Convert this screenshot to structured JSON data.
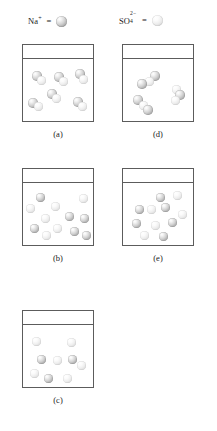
{
  "figure": {
    "caption": ""
  },
  "legend": {
    "entries": [
      {
        "id": "na",
        "species": "Na",
        "charge_sign": "+",
        "charge_number": "",
        "label_text": "Na+",
        "equals": "=",
        "sphere_kind": "cation",
        "sphere_color": "#b4b4b4",
        "icon_name": "cation-sphere-icon"
      },
      {
        "id": "so4",
        "species": "SO",
        "subscript": "4",
        "superscript": "2−",
        "label_text": "SO4 2-",
        "equals": "=",
        "sphere_kind": "anion",
        "sphere_color": "#e2e2e2",
        "icon_name": "anion-sphere-icon"
      }
    ]
  },
  "panels": [
    {
      "id": "a",
      "label": "(a)",
      "column": "left",
      "description": "ion pairs, cation and anion touching",
      "beaker": {
        "x": 22,
        "y": 44,
        "w": 72,
        "h": 78,
        "waterline_y": 13
      },
      "spheres": [
        {
          "kind": "cation",
          "x": 9,
          "y": 26,
          "d": 9.5
        },
        {
          "kind": "anion",
          "x": 14,
          "y": 31,
          "d": 8.5
        },
        {
          "kind": "cation",
          "x": 31,
          "y": 27,
          "d": 9.5
        },
        {
          "kind": "anion",
          "x": 36,
          "y": 32,
          "d": 8.5
        },
        {
          "kind": "cation",
          "x": 52,
          "y": 24,
          "d": 9.5
        },
        {
          "kind": "anion",
          "x": 56,
          "y": 30,
          "d": 8.5
        },
        {
          "kind": "cation",
          "x": 24,
          "y": 44,
          "d": 9.5
        },
        {
          "kind": "anion",
          "x": 29,
          "y": 49,
          "d": 8.5
        },
        {
          "kind": "cation",
          "x": 5,
          "y": 53,
          "d": 9.5
        },
        {
          "kind": "anion",
          "x": 11,
          "y": 57,
          "d": 8.5
        },
        {
          "kind": "cation",
          "x": 50,
          "y": 52,
          "d": 9.5
        },
        {
          "kind": "anion",
          "x": 55,
          "y": 57,
          "d": 8.5
        }
      ]
    },
    {
      "id": "b",
      "label": "(b)",
      "column": "left",
      "description": "fully dissociated, many separate ions",
      "beaker": {
        "x": 22,
        "y": 168,
        "w": 72,
        "h": 78,
        "waterline_y": 13
      },
      "spheres": [
        {
          "kind": "cation",
          "x": 13,
          "y": 24,
          "d": 8.5
        },
        {
          "kind": "anion",
          "x": 56,
          "y": 25,
          "d": 8.5
        },
        {
          "kind": "anion",
          "x": 3,
          "y": 35,
          "d": 8.5
        },
        {
          "kind": "anion",
          "x": 28,
          "y": 33,
          "d": 8.5
        },
        {
          "kind": "cation",
          "x": 42,
          "y": 43,
          "d": 8.5
        },
        {
          "kind": "anion",
          "x": 18,
          "y": 45,
          "d": 8.5
        },
        {
          "kind": "cation",
          "x": 57,
          "y": 45,
          "d": 8.5
        },
        {
          "kind": "cation",
          "x": 7,
          "y": 55,
          "d": 8.5
        },
        {
          "kind": "anion",
          "x": 30,
          "y": 55,
          "d": 8.5
        },
        {
          "kind": "cation",
          "x": 47,
          "y": 58,
          "d": 8.5
        },
        {
          "kind": "anion",
          "x": 19,
          "y": 62,
          "d": 8.5
        },
        {
          "kind": "cation",
          "x": 59,
          "y": 62,
          "d": 8.5
        }
      ]
    },
    {
      "id": "c",
      "label": "(c)",
      "column": "left",
      "description": "few ions, low concentration",
      "beaker": {
        "x": 22,
        "y": 310,
        "w": 72,
        "h": 78,
        "waterline_y": 13
      },
      "spheres": [
        {
          "kind": "anion",
          "x": 9,
          "y": 26,
          "d": 8.5
        },
        {
          "kind": "anion",
          "x": 44,
          "y": 27,
          "d": 8.5
        },
        {
          "kind": "cation",
          "x": 14,
          "y": 44,
          "d": 8.5
        },
        {
          "kind": "anion",
          "x": 30,
          "y": 45,
          "d": 8.5
        },
        {
          "kind": "cation",
          "x": 45,
          "y": 44,
          "d": 8.5
        },
        {
          "kind": "anion",
          "x": 54,
          "y": 50,
          "d": 8.5
        },
        {
          "kind": "anion",
          "x": 7,
          "y": 58,
          "d": 8.5
        },
        {
          "kind": "cation",
          "x": 21,
          "y": 63,
          "d": 8.5
        },
        {
          "kind": "anion",
          "x": 40,
          "y": 63,
          "d": 8.5
        }
      ]
    },
    {
      "id": "d",
      "label": "(d)",
      "column": "right",
      "description": "clustered aggregates of ions",
      "beaker": {
        "x": 122,
        "y": 44,
        "w": 72,
        "h": 78,
        "waterline_y": 13
      },
      "spheres": [
        {
          "kind": "cation",
          "x": 27,
          "y": 26,
          "d": 9.5
        },
        {
          "kind": "anion",
          "x": 22,
          "y": 32,
          "d": 8.5
        },
        {
          "kind": "cation",
          "x": 14,
          "y": 34,
          "d": 9.5
        },
        {
          "kind": "anion",
          "x": 49,
          "y": 40,
          "d": 8.5
        },
        {
          "kind": "cation",
          "x": 52,
          "y": 45,
          "d": 9.5
        },
        {
          "kind": "anion",
          "x": 48,
          "y": 51,
          "d": 8.5
        },
        {
          "kind": "cation",
          "x": 10,
          "y": 50,
          "d": 9.5
        },
        {
          "kind": "anion",
          "x": 16,
          "y": 56,
          "d": 8.5
        },
        {
          "kind": "cation",
          "x": 20,
          "y": 60,
          "d": 9.5
        }
      ]
    },
    {
      "id": "e",
      "label": "(e)",
      "column": "right",
      "description": "dissociated ions, moderate concentration",
      "beaker": {
        "x": 122,
        "y": 168,
        "w": 72,
        "h": 78,
        "waterline_y": 13
      },
      "spheres": [
        {
          "kind": "cation",
          "x": 33,
          "y": 24,
          "d": 8.5
        },
        {
          "kind": "anion",
          "x": 50,
          "y": 22,
          "d": 8.5
        },
        {
          "kind": "cation",
          "x": 12,
          "y": 36,
          "d": 8.5
        },
        {
          "kind": "anion",
          "x": 24,
          "y": 36,
          "d": 8.5
        },
        {
          "kind": "cation",
          "x": 38,
          "y": 34,
          "d": 8.5
        },
        {
          "kind": "anion",
          "x": 55,
          "y": 41,
          "d": 8.5
        },
        {
          "kind": "cation",
          "x": 9,
          "y": 50,
          "d": 8.5
        },
        {
          "kind": "anion",
          "x": 28,
          "y": 52,
          "d": 8.5
        },
        {
          "kind": "cation",
          "x": 45,
          "y": 49,
          "d": 8.5
        },
        {
          "kind": "anion",
          "x": 17,
          "y": 62,
          "d": 8.5
        },
        {
          "kind": "cation",
          "x": 36,
          "y": 63,
          "d": 8.5
        }
      ]
    }
  ]
}
